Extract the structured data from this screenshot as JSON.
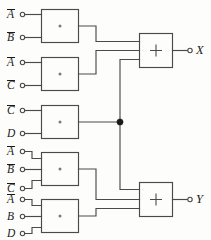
{
  "diagram": {
    "colors": {
      "background": "#fdfdfb",
      "wire": "#4a4a4a",
      "text": "#1a1a1a",
      "junction": "#1a1a1a"
    },
    "and_symbol": "·",
    "or_symbol": "+",
    "and_gates": [
      {
        "id": "and-1",
        "symbol": "·",
        "inputs": [
          {
            "name": "A",
            "negated": true
          },
          {
            "name": "B",
            "negated": true
          }
        ]
      },
      {
        "id": "and-2",
        "symbol": "·",
        "inputs": [
          {
            "name": "A",
            "negated": true
          },
          {
            "name": "C",
            "negated": true
          }
        ]
      },
      {
        "id": "and-3",
        "symbol": "·",
        "inputs": [
          {
            "name": "C",
            "negated": true
          },
          {
            "name": "D",
            "negated": false
          }
        ]
      },
      {
        "id": "and-4",
        "symbol": "·",
        "inputs": [
          {
            "name": "A",
            "negated": true
          },
          {
            "name": "B",
            "negated": true
          },
          {
            "name": "C",
            "negated": true
          }
        ]
      },
      {
        "id": "and-5",
        "symbol": "·",
        "inputs": [
          {
            "name": "A",
            "negated": true
          },
          {
            "name": "B",
            "negated": false
          },
          {
            "name": "D",
            "negated": false
          }
        ]
      }
    ],
    "or_gates": [
      {
        "id": "or-x",
        "symbol": "+",
        "output": "X"
      },
      {
        "id": "or-y",
        "symbol": "+",
        "output": "Y"
      }
    ],
    "outputs": [
      {
        "label": "X"
      },
      {
        "label": "Y"
      }
    ],
    "input_labels": [
      {
        "text": "A",
        "negated": true,
        "x": 9,
        "y": 8
      },
      {
        "text": "B",
        "negated": true,
        "x": 9,
        "y": 38
      },
      {
        "text": "A",
        "negated": true,
        "x": 9,
        "y": 58
      },
      {
        "text": "C",
        "negated": true,
        "x": 9,
        "y": 86
      },
      {
        "text": "C",
        "negated": true,
        "x": 9,
        "y": 106
      },
      {
        "text": "D",
        "negated": false,
        "x": 9,
        "y": 133
      },
      {
        "text": "A",
        "negated": true,
        "x": 9,
        "y": 143
      },
      {
        "text": "B",
        "negated": true,
        "x": 9,
        "y": 166
      },
      {
        "text": "C",
        "negated": true,
        "x": 9,
        "y": 187
      },
      {
        "text": "A",
        "negated": true,
        "x": 9,
        "y": 196
      },
      {
        "text": "B",
        "negated": false,
        "x": 9,
        "y": 214
      },
      {
        "text": "D",
        "negated": false,
        "x": 9,
        "y": 229
      }
    ]
  }
}
